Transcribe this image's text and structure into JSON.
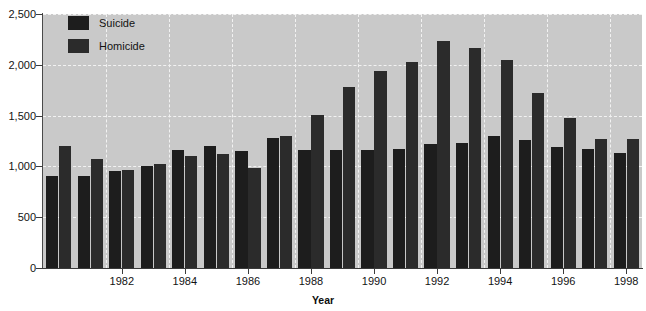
{
  "chart_data": {
    "type": "bar",
    "title": "",
    "xlabel": "Year",
    "ylabel": "",
    "ylim": [
      0,
      2500
    ],
    "yticks": [
      0,
      500,
      1000,
      1500,
      2000,
      2500
    ],
    "ytick_labels": [
      "0",
      "500",
      "1,000",
      "1,500",
      "2,000",
      "2,500"
    ],
    "grid": true,
    "legend_position": "top-left",
    "categories": [
      "1980",
      "1981",
      "1982",
      "1983",
      "1984",
      "1985",
      "1986",
      "1987",
      "1988",
      "1989",
      "1990",
      "1991",
      "1992",
      "1993",
      "1994",
      "1995",
      "1996",
      "1997",
      "1998"
    ],
    "xtick_labels": [
      "1982",
      "1984",
      "1986",
      "1988",
      "1990",
      "1992",
      "1994",
      "1996",
      "1998"
    ],
    "series": [
      {
        "name": "Suicide",
        "color": "#1d1d1d",
        "values": [
          910,
          905,
          955,
          1000,
          1160,
          1205,
          1150,
          1280,
          1165,
          1165,
          1165,
          1170,
          1225,
          1230,
          1300,
          1260,
          1190,
          1175,
          1130
        ]
      },
      {
        "name": "Homicide",
        "color": "#2b2b2b",
        "values": [
          1200,
          1075,
          960,
          1020,
          1100,
          1120,
          985,
          1300,
          1510,
          1780,
          1935,
          2025,
          2230,
          2170,
          2050,
          1720,
          1480,
          1270,
          1270
        ]
      }
    ]
  },
  "legend": {
    "items": [
      {
        "label": "Suicide"
      },
      {
        "label": "Homicide"
      }
    ]
  },
  "axis": {
    "x_title": "Year"
  }
}
